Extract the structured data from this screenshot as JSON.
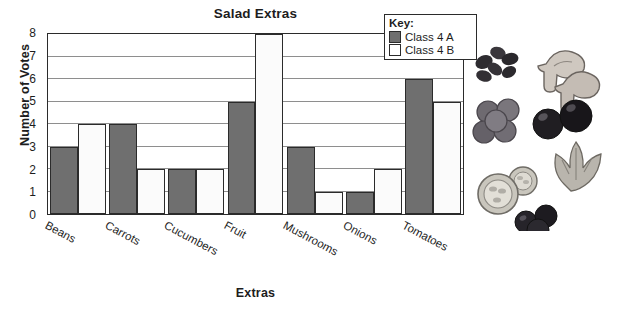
{
  "chart_data": {
    "type": "bar",
    "title": "Salad Extras",
    "xlabel": "Extras",
    "ylabel": "Number of Votes",
    "categories": [
      "Beans",
      "Carrots",
      "Cucumbers",
      "Fruit",
      "Mushrooms",
      "Onions",
      "Tomatoes"
    ],
    "series": [
      {
        "name": "Class 4 A",
        "values": [
          3,
          4,
          2,
          5,
          3,
          1,
          6
        ],
        "color": "#6f6f6f"
      },
      {
        "name": "Class 4 B",
        "values": [
          4,
          2,
          2,
          8,
          1,
          2,
          5
        ],
        "color": "#ffffff"
      }
    ],
    "ylim": [
      0,
      8
    ],
    "yticks": [
      0,
      1,
      2,
      3,
      4,
      5,
      6,
      7,
      8
    ],
    "grid": true,
    "legend_position": "top-right"
  },
  "legend": {
    "title": "Key:",
    "entries": [
      {
        "label": "Class 4 A",
        "swatch": "filled-gray-swatch"
      },
      {
        "label": "Class 4 B",
        "swatch": "empty-white-swatch"
      }
    ]
  },
  "illustration": {
    "name": "salad-ingredients-illustration",
    "items": [
      "black-beans",
      "mushrooms",
      "grapes",
      "olives",
      "cucumber-slices",
      "lettuce-leaves",
      "black-olives"
    ]
  }
}
